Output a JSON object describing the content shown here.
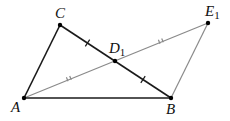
{
  "diagram": {
    "type": "geometry",
    "points": {
      "A": {
        "label": "A",
        "sub": "",
        "x": 24,
        "y": 98
      },
      "B": {
        "label": "B",
        "sub": "",
        "x": 171,
        "y": 98
      },
      "C": {
        "label": "C",
        "sub": "",
        "x": 60,
        "y": 25
      },
      "D1": {
        "label": "D",
        "sub": "1",
        "x": 115,
        "y": 61
      },
      "E1": {
        "label": "E",
        "sub": "1",
        "x": 208,
        "y": 23
      }
    },
    "segments": [
      {
        "from": "A",
        "to": "C",
        "color": "#1a1a1a"
      },
      {
        "from": "C",
        "to": "B",
        "color": "#1a1a1a"
      },
      {
        "from": "A",
        "to": "B",
        "color": "#1a1a1a"
      },
      {
        "from": "A",
        "to": "E1",
        "color": "#8a8a8a"
      },
      {
        "from": "E1",
        "to": "B",
        "color": "#8a8a8a"
      }
    ],
    "tick_marks": [
      {
        "segment": "C-D1",
        "count": 1
      },
      {
        "segment": "D1-B",
        "count": 1
      },
      {
        "segment": "A-D1",
        "count": 2
      },
      {
        "segment": "D1-E1",
        "count": 2
      }
    ],
    "colors": {
      "dark_line": "#1a1a1a",
      "light_line": "#8a8a8a",
      "point": "#000000"
    }
  }
}
